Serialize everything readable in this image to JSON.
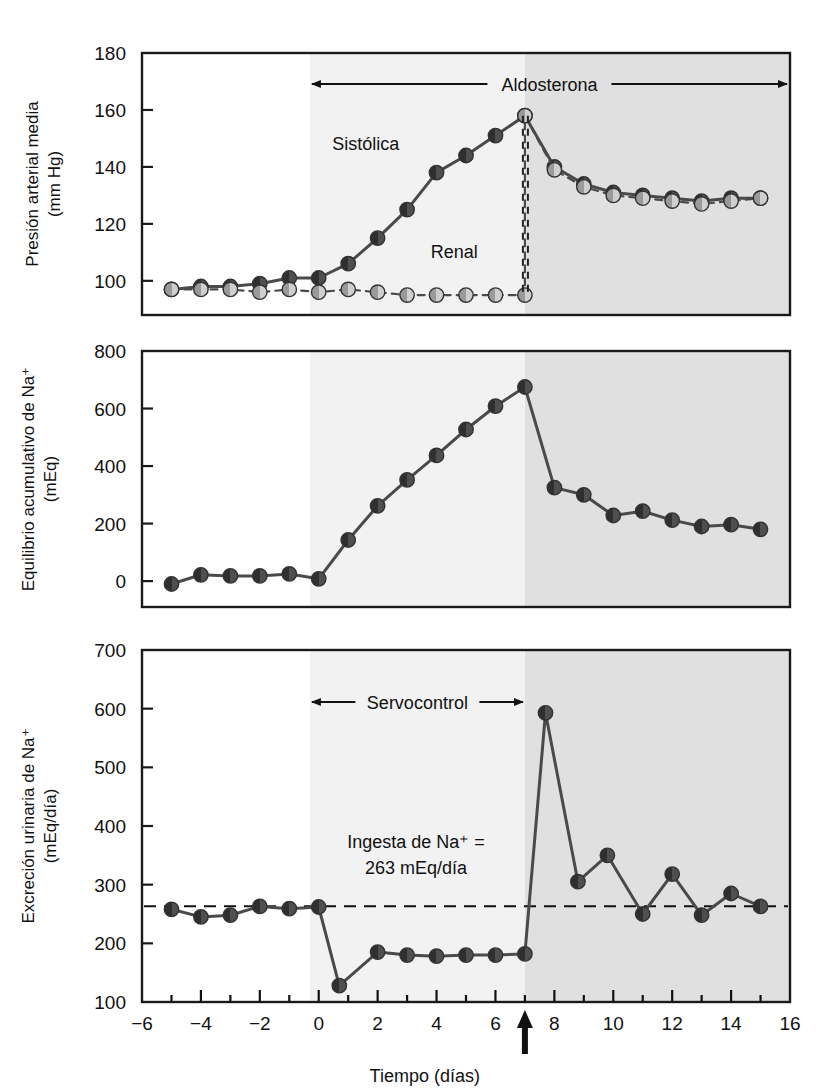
{
  "figure": {
    "xaxis": {
      "label": "Tiempo (días)",
      "ticks": [
        -6,
        -4,
        -2,
        0,
        2,
        4,
        6,
        8,
        10,
        12,
        14,
        16
      ],
      "tick_labels": [
        "−6",
        "−4",
        "−2",
        "0",
        "2",
        "4",
        "6",
        "8",
        "10",
        "12",
        "14",
        "16"
      ],
      "min": -6,
      "max": 16,
      "minor_step": 1,
      "marker_arrow_day": 7
    },
    "shading": {
      "light_start_day": -0.3,
      "light_end_day": 7,
      "dark_start_day": 7,
      "dark_end_day": 16,
      "light_color": "#f2f2f2",
      "dark_color": "#e0e0e0"
    },
    "colors": {
      "systolic_marker": "#3f3f3f",
      "renal_marker": "#b8b8b8",
      "line": "#4a4a4a",
      "axis": "#1a1a1a"
    }
  },
  "panels": [
    {
      "id": "mean-arterial-pressure",
      "ylabel_line1": "Presión arterial media",
      "ylabel_line2": "(mm Hg)",
      "ylim": [
        88,
        180
      ],
      "yticks": [
        100,
        120,
        140,
        160,
        180
      ],
      "ytick_labels": [
        "100",
        "120",
        "140",
        "160",
        "180"
      ],
      "annotations": {
        "range_arrow_label": "Aldosterona",
        "series_label_systolic": "Sistólica",
        "series_label_renal": "Renal"
      }
    },
    {
      "id": "cumulative-na-balance",
      "ylabel_line1": "Equilibrio acumulativo de Na⁺",
      "ylabel_line2": "(mEq)",
      "ylim": [
        -90,
        800
      ],
      "yticks": [
        0,
        200,
        400,
        600,
        800
      ],
      "ytick_labels": [
        "0",
        "200",
        "400",
        "600",
        "800"
      ],
      "annotations": {}
    },
    {
      "id": "urinary-na-excretion",
      "ylabel_line1": "Excreción urinaria de Na⁺",
      "ylabel_line2": "(mEq/día)",
      "ylim": [
        100,
        700
      ],
      "yticks": [
        100,
        200,
        300,
        400,
        500,
        600,
        700
      ],
      "ytick_labels": [
        "100",
        "200",
        "300",
        "400",
        "500",
        "600",
        "700"
      ],
      "annotations": {
        "range_arrow_label": "Servocontrol",
        "intake_line1": "Ingesta de Na⁺ =",
        "intake_line2": "263 mEq/día",
        "intake_value": 263
      }
    }
  ],
  "chart_data": [
    {
      "type": "line",
      "title": "Presión arterial media (mm Hg)",
      "xlabel": "Tiempo (días)",
      "ylabel": "Presión arterial media (mm Hg)",
      "xlim": [
        -6,
        16
      ],
      "ylim": [
        88,
        180
      ],
      "grid": false,
      "legend": "inline-labels",
      "series": [
        {
          "name": "Sistólica",
          "marker": "filled-dark-circle",
          "linestyle": "solid",
          "x": [
            -5,
            -4,
            -3,
            -2,
            -1,
            0,
            1,
            2,
            3,
            4,
            5,
            6,
            7,
            8,
            9,
            10,
            11,
            12,
            13,
            14,
            15
          ],
          "y": [
            97,
            98,
            98,
            99,
            101,
            101,
            106,
            115,
            125,
            138,
            144,
            151,
            158,
            140,
            134,
            131,
            130,
            129,
            128,
            129,
            129
          ]
        },
        {
          "name": "Renal",
          "marker": "filled-light-circle",
          "linestyle": "dashed",
          "x": [
            -5,
            -4,
            -3,
            -2,
            -1,
            0,
            1,
            2,
            3,
            4,
            5,
            6,
            7,
            7,
            8,
            9,
            10,
            11,
            12,
            13,
            14,
            15
          ],
          "y": [
            97,
            97,
            97,
            96,
            97,
            96,
            97,
            96,
            95,
            95,
            95,
            95,
            95,
            158,
            139,
            133,
            130,
            129,
            128,
            127,
            128,
            129
          ]
        }
      ]
    },
    {
      "type": "line",
      "title": "Equilibrio acumulativo de Na+ (mEq)",
      "xlabel": "Tiempo (días)",
      "ylabel": "Equilibrio acumulativo de Na⁺ (mEq)",
      "xlim": [
        -6,
        16
      ],
      "ylim": [
        -90,
        800
      ],
      "grid": false,
      "series": [
        {
          "name": "Equilibrio acumulativo de Na+",
          "marker": "filled-dark-circle",
          "linestyle": "solid",
          "x": [
            -5,
            -4,
            -3,
            -2,
            -1,
            0,
            1,
            2,
            3,
            4,
            5,
            6,
            7,
            8,
            9,
            10,
            11,
            12,
            13,
            14,
            15
          ],
          "y": [
            -10,
            22,
            18,
            18,
            25,
            8,
            143,
            262,
            352,
            437,
            527,
            608,
            675,
            325,
            300,
            228,
            243,
            212,
            190,
            196,
            180
          ]
        }
      ]
    },
    {
      "type": "line",
      "title": "Excreción urinaria de Na+ (mEq/día)",
      "xlabel": "Tiempo (días)",
      "ylabel": "Excreción urinaria de Na⁺ (mEq/día)",
      "xlim": [
        -6,
        16
      ],
      "ylim": [
        100,
        700
      ],
      "grid": false,
      "reference_line": {
        "label": "Ingesta de Na⁺ = 263 mEq/día",
        "value": 263,
        "style": "dashed"
      },
      "series": [
        {
          "name": "Excreción urinaria de Na+",
          "marker": "filled-dark-circle",
          "linestyle": "solid",
          "x": [
            -5,
            -4,
            -3,
            -2,
            -1,
            0,
            0.7,
            2,
            3,
            4,
            5,
            6,
            7,
            7.7,
            8.8,
            9.8,
            11,
            12,
            13,
            14,
            15
          ],
          "y": [
            258,
            245,
            248,
            263,
            259,
            262,
            128,
            185,
            180,
            178,
            180,
            180,
            182,
            593,
            305,
            350,
            250,
            318,
            248,
            285,
            263
          ]
        }
      ]
    }
  ]
}
